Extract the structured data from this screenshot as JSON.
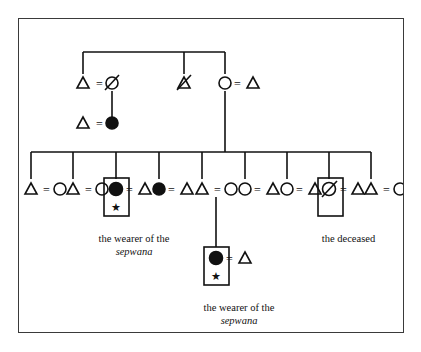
{
  "figure": {
    "background_color": "#ffffff",
    "border_color": "#3a3a3a",
    "ink_color": "#111111"
  },
  "legend": {
    "male_symbol": "triangle",
    "female_symbol": "circle",
    "female_highlighted_symbol": "filled-circle",
    "deceased_marker": "slash-through-symbol",
    "marriage_marker": "equals-sign",
    "sepwana_marker": "star",
    "enclosure_marker": "rectangle-box"
  },
  "labels": {
    "wearer_line1": "the wearer of the",
    "wearer_italic": "sepwana",
    "deceased": "the deceased"
  },
  "generations": {
    "g1": {
      "name": "grandparent-generation",
      "units": [
        {
          "id": "g1-u1",
          "left": {
            "sex": "male",
            "shape": "triangle",
            "deceased": false,
            "filled": false
          },
          "link": "=",
          "right": {
            "sex": "female",
            "shape": "circle",
            "deceased": true,
            "filled": false
          }
        },
        {
          "id": "g1-u2",
          "left": {
            "sex": "male",
            "shape": "triangle",
            "deceased": true,
            "filled": false
          },
          "link": "",
          "right": null
        },
        {
          "id": "g1-u3",
          "left": {
            "sex": "female",
            "shape": "circle",
            "deceased": false,
            "filled": false
          },
          "link": "=",
          "right": {
            "sex": "male",
            "shape": "triangle",
            "deceased": false,
            "filled": false
          }
        }
      ]
    },
    "g2": {
      "name": "parent-generation",
      "units": [
        {
          "id": "g2-u1",
          "left": {
            "sex": "male",
            "shape": "triangle",
            "deceased": false,
            "filled": false
          },
          "link": "=",
          "right": {
            "sex": "female",
            "shape": "circle",
            "deceased": false,
            "filled": true
          }
        }
      ]
    },
    "g3": {
      "name": "sibling-generation",
      "sibling_count": 9,
      "units": [
        {
          "id": "g3-u1",
          "left": {
            "sex": "male",
            "shape": "triangle",
            "deceased": false,
            "filled": false
          },
          "link": "=",
          "right": {
            "sex": "female",
            "shape": "circle",
            "deceased": false,
            "filled": false
          },
          "boxed": false,
          "star": false,
          "descent": false
        },
        {
          "id": "g3-u2",
          "left": {
            "sex": "male",
            "shape": "triangle",
            "deceased": false,
            "filled": false
          },
          "link": "=",
          "right": {
            "sex": "female",
            "shape": "circle",
            "deceased": false,
            "filled": false
          },
          "boxed": false,
          "star": false,
          "descent": false
        },
        {
          "id": "g3-u3",
          "left": {
            "sex": "female",
            "shape": "circle",
            "deceased": false,
            "filled": true
          },
          "link": "=",
          "right": {
            "sex": "male",
            "shape": "triangle",
            "deceased": false,
            "filled": false
          },
          "boxed": true,
          "star": true,
          "descent": false,
          "caption": "wearer"
        },
        {
          "id": "g3-u4",
          "left": {
            "sex": "female",
            "shape": "circle",
            "deceased": false,
            "filled": true
          },
          "link": "=",
          "right": {
            "sex": "male",
            "shape": "triangle",
            "deceased": false,
            "filled": false
          },
          "boxed": false,
          "star": false,
          "descent": false
        },
        {
          "id": "g3-u5",
          "left": {
            "sex": "male",
            "shape": "triangle",
            "deceased": false,
            "filled": false
          },
          "link": "=",
          "right": {
            "sex": "female",
            "shape": "circle",
            "deceased": false,
            "filled": false
          },
          "boxed": false,
          "star": false,
          "descent": true
        },
        {
          "id": "g3-u6",
          "left": {
            "sex": "female",
            "shape": "circle",
            "deceased": false,
            "filled": false
          },
          "link": "=",
          "right": {
            "sex": "male",
            "shape": "triangle",
            "deceased": false,
            "filled": false
          },
          "boxed": false,
          "star": false,
          "descent": false
        },
        {
          "id": "g3-u7",
          "left": {
            "sex": "female",
            "shape": "circle",
            "deceased": false,
            "filled": false
          },
          "link": "=",
          "right": {
            "sex": "male",
            "shape": "triangle",
            "deceased": false,
            "filled": false
          },
          "boxed": false,
          "star": false,
          "descent": false
        },
        {
          "id": "g3-u8",
          "left": {
            "sex": "female",
            "shape": "circle",
            "deceased": true,
            "filled": false
          },
          "link": "=",
          "right": {
            "sex": "male",
            "shape": "triangle",
            "deceased": false,
            "filled": false
          },
          "boxed": true,
          "star": false,
          "descent": false,
          "caption": "deceased"
        },
        {
          "id": "g3-u9",
          "left": {
            "sex": "male",
            "shape": "triangle",
            "deceased": false,
            "filled": false
          },
          "link": "=",
          "right": {
            "sex": "female",
            "shape": "circle",
            "deceased": false,
            "filled": false
          },
          "boxed": false,
          "star": false,
          "descent": false
        }
      ]
    },
    "g4": {
      "name": "child-generation",
      "units": [
        {
          "id": "g4-u1",
          "left": {
            "sex": "female",
            "shape": "circle",
            "deceased": false,
            "filled": true
          },
          "link": "=",
          "right": {
            "sex": "male",
            "shape": "triangle",
            "deceased": false,
            "filled": false
          },
          "boxed": true,
          "star": true,
          "caption": "wearer"
        }
      ]
    }
  }
}
